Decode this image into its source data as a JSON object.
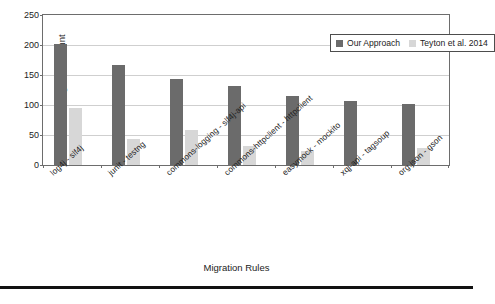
{
  "chart_data": {
    "type": "bar",
    "title": "",
    "xlabel": "Migration Rules",
    "ylabel": "Migration Count",
    "ylim": [
      0,
      250
    ],
    "yticks": [
      0,
      50,
      100,
      150,
      200,
      250
    ],
    "ytick_labels": [
      "0",
      "50",
      "100",
      "150",
      "200",
      "250"
    ],
    "grid": true,
    "legend_position": "top-right",
    "categories": [
      "log4j - slf4j",
      "junit - testng",
      "commons-logging - slf4j-api",
      "commons-httpclient - httpclient",
      "easymock - mockito",
      "xqj-api - tagsoup",
      "org.json - gson"
    ],
    "series": [
      {
        "name": "Our Approach",
        "color": "#6b6b6b",
        "values": [
          202,
          166,
          144,
          131,
          115,
          107,
          101
        ]
      },
      {
        "name": "Teyton et al. 2014",
        "color": "#d7d7d7",
        "values": [
          95,
          44,
          59,
          32,
          23,
          0,
          28
        ]
      }
    ]
  },
  "legend": {
    "items": [
      {
        "label": "Our Approach",
        "swatch": "#6b6b6b"
      },
      {
        "label": "Teyton et al. 2014",
        "swatch": "#d7d7d7"
      }
    ]
  }
}
